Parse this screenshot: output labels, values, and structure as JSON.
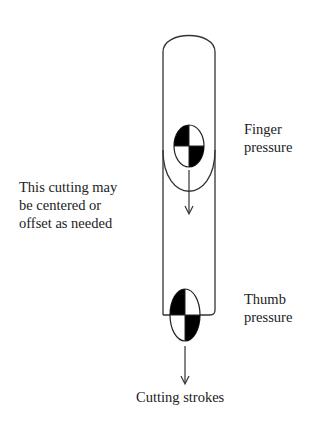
{
  "diagram": {
    "labels": {
      "finger_pressure": [
        "Finger",
        "pressure"
      ],
      "thumb_pressure": [
        "Thumb",
        "pressure"
      ],
      "cutting_note": [
        "This cutting may",
        "be centered or",
        "offset as needed"
      ],
      "cutting_strokes": "Cutting strokes"
    },
    "elements": [
      {
        "type": "rounded-frame",
        "name": "cutting-tool-outline"
      },
      {
        "type": "u-curve",
        "name": "finger-cup"
      },
      {
        "type": "quartered-ellipse",
        "name": "finger-pressure-marker"
      },
      {
        "type": "quartered-ellipse",
        "name": "thumb-pressure-marker"
      },
      {
        "type": "arrow-down",
        "name": "upper-direction-arrow"
      },
      {
        "type": "arrow-down",
        "name": "cutting-stroke-arrow"
      }
    ],
    "colors": {
      "line": "#333333",
      "fill": "#000000",
      "background": "#ffffff"
    }
  }
}
